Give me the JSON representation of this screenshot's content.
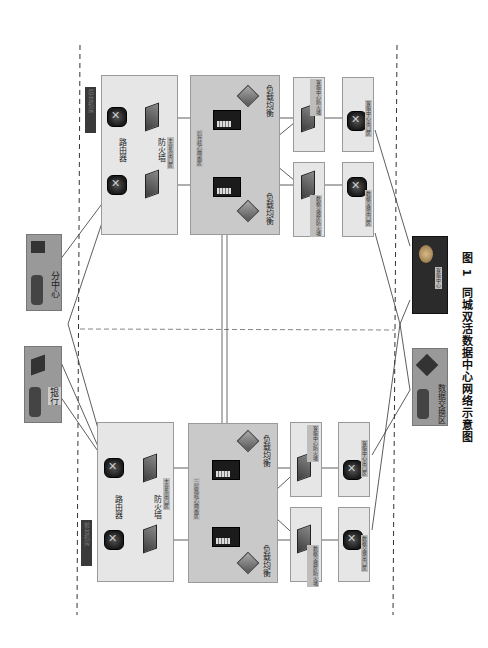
{
  "caption": {
    "figure_no": "图 1",
    "title": "同城双活数据中心网络示意图"
  },
  "data_centers": {
    "upper": {
      "tag": "后台机房",
      "router_zone": {
        "router_label": "路由器",
        "firewall_label": "防火墙",
        "zone_tag": "主业务出口区"
      },
      "core_zone": {
        "zone_tag": "后台核心网络区",
        "lb_left": "负载均衡",
        "lb_right": "负载均衡"
      },
      "fw_exchange": "数据交换区防火墙",
      "fw_service": "客服中心防火墙",
      "exit_exchange": "数据交换出口区",
      "exit_service": "客服中心出口区"
    },
    "lower": {
      "tag": "前台机房",
      "router_zone": {
        "router_label": "路由器",
        "firewall_label": "防火墙",
        "zone_tag": "主业务出口区"
      },
      "core_zone": {
        "zone_tag": "三层路核心网络区",
        "lb_left": "负载均衡",
        "lb_right": "负载均衡"
      },
      "fw_exchange": "数据交换区防火墙",
      "fw_service": "客服中心防火墙",
      "exit_exchange": "数据交换出口区",
      "exit_service": "客服中心出口区"
    }
  },
  "external": {
    "branch": "分中心",
    "bank": "银行",
    "service_center": "客服中心",
    "exchange_zone": "数据交换区"
  },
  "colors": {
    "zone_light": "#e6e6e6",
    "zone_mid": "#c9c9c9",
    "tag_dark": "#3a3a3a",
    "line": "#444444"
  }
}
